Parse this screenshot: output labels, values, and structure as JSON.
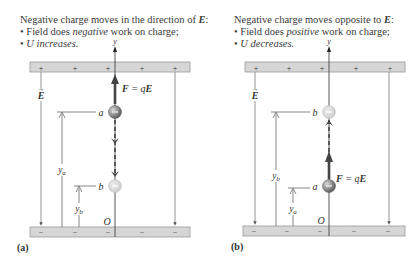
{
  "panels": [
    {
      "id": "a",
      "panel_label": "(a)",
      "heading": {
        "line1_prefix": "Negative charge moves in the direction of ",
        "line1_vector": "E",
        "line1_suffix": ":",
        "bullet2_prefix": "Field does ",
        "bullet2_emph": "negative",
        "bullet2_suffix": " work on charge;",
        "bullet3": "U increases."
      },
      "top_plate_signs": [
        "+",
        "+",
        "+",
        "+",
        "+"
      ],
      "bottom_plate_signs": [
        "−",
        "−",
        "−",
        "−",
        "−"
      ],
      "axis_label": "y",
      "origin_label": "O",
      "field_label": "E",
      "force_label": "F = qE",
      "charge_upper": {
        "label": "a",
        "sign": "−",
        "state": "start"
      },
      "charge_lower": {
        "label": "b",
        "sign": "−",
        "state": "end"
      },
      "height_upper": "ya",
      "height_lower": "yb",
      "motion": "down"
    },
    {
      "id": "b",
      "panel_label": "(b)",
      "heading": {
        "line1_prefix": "Negative charge moves opposite to ",
        "line1_vector": "E",
        "line1_suffix": ":",
        "bullet2_prefix": "Field does ",
        "bullet2_emph": "positive",
        "bullet2_suffix": " work on charge;",
        "bullet3": "U decreases."
      },
      "top_plate_signs": [
        "+",
        "+",
        "+",
        "+",
        "+"
      ],
      "bottom_plate_signs": [
        "−",
        "−",
        "−",
        "−",
        "−"
      ],
      "axis_label": "y",
      "origin_label": "O",
      "field_label": "E",
      "force_label": "F = qE",
      "charge_upper": {
        "label": "b",
        "sign": "−",
        "state": "end"
      },
      "charge_lower": {
        "label": "a",
        "sign": "−",
        "state": "start"
      },
      "height_upper": "yb",
      "height_lower": "ya",
      "motion": "up"
    }
  ],
  "colors": {
    "plate_fill": "#d6d6d6",
    "plate_border": "#9a9a9a",
    "line": "#555555",
    "charge_solid": "#8a8a8a",
    "charge_faded": "#d2d2d2",
    "arrow": "#444444"
  }
}
